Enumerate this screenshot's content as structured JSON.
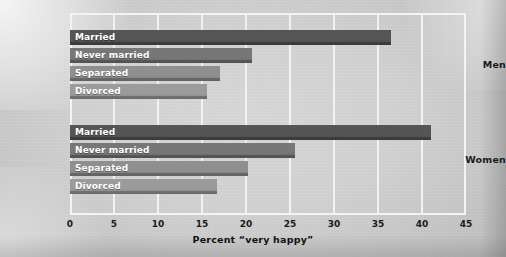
{
  "chart_data": {
    "type": "bar",
    "orientation": "horizontal",
    "title": "",
    "xlabel": "Percent “very happy”",
    "ylabel": "",
    "xlim": [
      0,
      45
    ],
    "xticks": [
      0,
      5,
      10,
      15,
      20,
      25,
      30,
      35,
      40,
      45
    ],
    "xtick_labels": [
      "0",
      "5",
      "10",
      "15",
      "20",
      "25",
      "30",
      "35",
      "40",
      "45"
    ],
    "grid": true,
    "grid_axis": "x",
    "legend": "none",
    "categories": [
      "Married",
      "Never married",
      "Separated",
      "Divorced"
    ],
    "groups": [
      {
        "name": "Men",
        "bars": [
          {
            "label": "Married",
            "value": 36.5,
            "color": "#555555"
          },
          {
            "label": "Never married",
            "value": 20.7,
            "color": "#777777"
          },
          {
            "label": "Separated",
            "value": 17.0,
            "color": "#8f8f8f"
          },
          {
            "label": "Divorced",
            "value": 15.6,
            "color": "#9b9b9b"
          }
        ]
      },
      {
        "name": "Women",
        "bars": [
          {
            "label": "Married",
            "value": 41.0,
            "color": "#555555"
          },
          {
            "label": "Never married",
            "value": 25.6,
            "color": "#777777"
          },
          {
            "label": "Separated",
            "value": 20.2,
            "color": "#8f8f8f"
          },
          {
            "label": "Divorced",
            "value": 16.7,
            "color": "#9b9b9b"
          }
        ]
      }
    ],
    "colors": {
      "background": "#d2d2d2",
      "gridline": "#f2f2f2",
      "frame": "#f4f4f4",
      "text": "#1a1a1a",
      "bar_label_text": "#ffffff"
    }
  }
}
